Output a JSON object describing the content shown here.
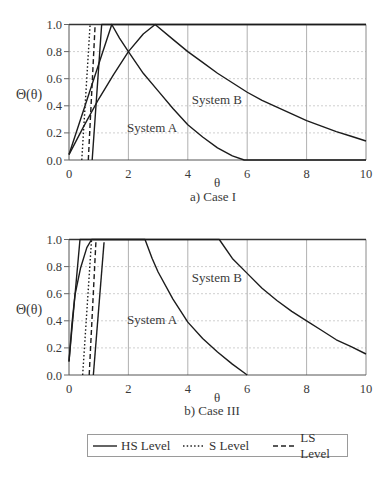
{
  "figure": {
    "legend": {
      "items": [
        {
          "label": "HS Level",
          "style": "solid"
        },
        {
          "label": "S Level",
          "style": "dotted"
        },
        {
          "label": "LS Level",
          "style": "dashed"
        }
      ]
    }
  },
  "chart_data": [
    {
      "type": "line",
      "title": "a) Case I",
      "xlabel": "θ",
      "ylabel": "Θ(θ)",
      "xlim": [
        0,
        10
      ],
      "ylim": [
        0,
        1
      ],
      "xticks": [
        0,
        2,
        4,
        6,
        8,
        10
      ],
      "xtick_labels": [
        "0",
        "2",
        "4",
        "6",
        "8",
        "10"
      ],
      "yticks": [
        0,
        0.2,
        0.4,
        0.6,
        0.8,
        1.0
      ],
      "ytick_labels": [
        "0.0",
        "0.2",
        "0.4",
        "0.6",
        "0.8",
        "1.0"
      ],
      "grid": {
        "vertical": "solid",
        "horizontal": "dotted"
      },
      "annotations": [
        {
          "text": "System A",
          "x": 2.8,
          "y": 0.24
        },
        {
          "text": "System B",
          "x": 4.98,
          "y": 0.45
        }
      ],
      "series": [
        {
          "name": "System A - HS Level",
          "style": "solid",
          "points": [
            [
              0,
              0.04
            ],
            [
              1.44,
              1.0
            ],
            [
              1.7,
              0.9
            ],
            [
              2,
              0.8
            ],
            [
              2.5,
              0.64
            ],
            [
              3,
              0.51
            ],
            [
              3.5,
              0.38
            ],
            [
              4,
              0.26
            ],
            [
              4.5,
              0.17
            ],
            [
              5,
              0.09
            ],
            [
              5.5,
              0.03
            ],
            [
              5.9,
              0
            ],
            [
              10,
              0
            ]
          ]
        },
        {
          "name": "System B - HS Level",
          "style": "solid",
          "points": [
            [
              0,
              0.04
            ],
            [
              0.5,
              0.25
            ],
            [
              1,
              0.45
            ],
            [
              1.5,
              0.63
            ],
            [
              2,
              0.8
            ],
            [
              2.5,
              0.93
            ],
            [
              2.9,
              1.0
            ],
            [
              3.5,
              0.89
            ],
            [
              4,
              0.8
            ],
            [
              4.5,
              0.72
            ],
            [
              5,
              0.64
            ],
            [
              5.5,
              0.57
            ],
            [
              6,
              0.5
            ],
            [
              6.5,
              0.44
            ],
            [
              7,
              0.39
            ],
            [
              7.5,
              0.34
            ],
            [
              8,
              0.29
            ],
            [
              8.5,
              0.25
            ],
            [
              9,
              0.21
            ],
            [
              9.5,
              0.175
            ],
            [
              10,
              0.14
            ]
          ]
        },
        {
          "name": "HS Level (steep)",
          "style": "solid",
          "points": [
            [
              0.78,
              0
            ],
            [
              1.1,
              1.0
            ],
            [
              10,
              1.0
            ]
          ]
        },
        {
          "name": "S Level",
          "style": "dotted",
          "points": [
            [
              0.43,
              0
            ],
            [
              0.71,
              1.0
            ]
          ]
        },
        {
          "name": "LS Level",
          "style": "dashed",
          "points": [
            [
              0.65,
              0
            ],
            [
              0.88,
              1.0
            ]
          ]
        }
      ]
    },
    {
      "type": "line",
      "title": "b) Case III",
      "xlabel": "θ",
      "ylabel": "Θ(θ)",
      "xlim": [
        0,
        10
      ],
      "ylim": [
        0,
        1
      ],
      "xticks": [
        0,
        2,
        4,
        6,
        8,
        10
      ],
      "xtick_labels": [
        "0",
        "2",
        "4",
        "6",
        "8",
        "10"
      ],
      "yticks": [
        0,
        0.2,
        0.4,
        0.6,
        0.8,
        1.0
      ],
      "ytick_labels": [
        "0.0",
        "0.2",
        "0.4",
        "0.6",
        "0.8",
        "1.0"
      ],
      "grid": {
        "vertical": "solid",
        "horizontal": "dotted"
      },
      "annotations": [
        {
          "text": "System A",
          "x": 2.8,
          "y": 0.41
        },
        {
          "text": "System B",
          "x": 4.98,
          "y": 0.72
        }
      ],
      "series": [
        {
          "name": "System A - HS Level",
          "style": "solid",
          "points": [
            [
              0,
              0.1
            ],
            [
              0.37,
              1.0
            ],
            [
              2.56,
              1.0
            ],
            [
              2.8,
              0.86
            ],
            [
              3,
              0.76
            ],
            [
              3.5,
              0.56
            ],
            [
              4,
              0.39
            ],
            [
              4.5,
              0.27
            ],
            [
              5,
              0.17
            ],
            [
              5.5,
              0.08
            ],
            [
              6,
              0
            ]
          ]
        },
        {
          "name": "System B - HS Level",
          "style": "solid",
          "points": [
            [
              0,
              0.1
            ],
            [
              0.1,
              0.38
            ],
            [
              0.2,
              0.59
            ],
            [
              0.39,
              0.79
            ],
            [
              0.6,
              0.94
            ],
            [
              0.76,
              1.0
            ],
            [
              5.06,
              1.0
            ],
            [
              5.5,
              0.86
            ],
            [
              6,
              0.75
            ],
            [
              6.5,
              0.64
            ],
            [
              7,
              0.55
            ],
            [
              7.5,
              0.47
            ],
            [
              8,
              0.4
            ],
            [
              8.5,
              0.33
            ],
            [
              9,
              0.26
            ],
            [
              9.5,
              0.21
            ],
            [
              10,
              0.155
            ]
          ]
        },
        {
          "name": "HS Level (steep)",
          "style": "solid",
          "points": [
            [
              0.82,
              0
            ],
            [
              1.18,
              0.98
            ]
          ]
        },
        {
          "name": "S Level",
          "style": "dotted",
          "points": [
            [
              0.46,
              0
            ],
            [
              0.76,
              1.0
            ]
          ]
        },
        {
          "name": "LS Level",
          "style": "dashed",
          "points": [
            [
              0.68,
              0
            ],
            [
              0.91,
              1.0
            ]
          ]
        }
      ]
    }
  ]
}
